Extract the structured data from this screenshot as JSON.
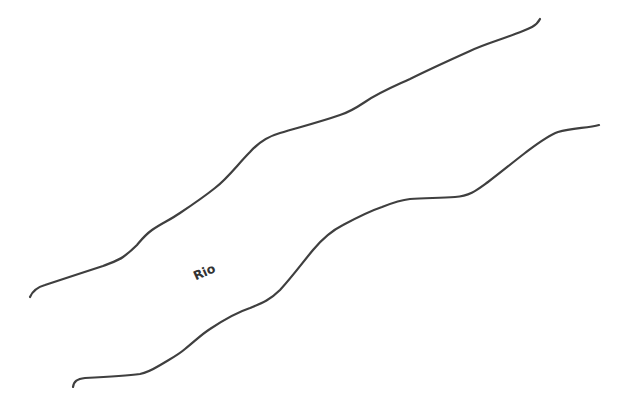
{
  "map": {
    "river": {
      "label": "Rio",
      "label_position": {
        "x": 206,
        "y": 276
      },
      "label_rotation_deg": -24
    },
    "colors": {
      "background": "#ffffff",
      "bank_stroke": "#3f3f3f",
      "label": "#333333"
    }
  }
}
